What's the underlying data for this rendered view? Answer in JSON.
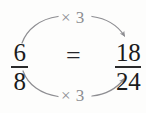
{
  "diagram": {
    "kind": "equivalent-fractions-diagram",
    "left_fraction": {
      "numerator": "6",
      "denominator": "8"
    },
    "right_fraction": {
      "numerator": "18",
      "denominator": "24"
    },
    "relation_symbol": "=",
    "top_operation_label": "× 3",
    "bottom_operation_label": "× 3",
    "colors": {
      "background": "#fdfdfc",
      "text": "#1b1b1b",
      "arrow": "#8e8e92",
      "label": "#8d8d91"
    },
    "arrows": {
      "top": {
        "label": "curved-arrow-top",
        "direction": "left-to-right",
        "points_to": "numerator"
      },
      "bottom": {
        "label": "curved-arrow-bottom",
        "direction": "left-to-right",
        "points_to": "denominator"
      }
    }
  }
}
